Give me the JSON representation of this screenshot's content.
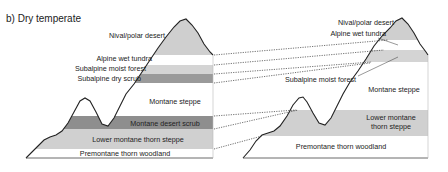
{
  "title": "b) Dry temperate",
  "left_mountain": {
    "zones": [
      {
        "label": "Nival/polar desert",
        "shade": "#cfcfcf"
      },
      {
        "label": "Alpine wet tundra",
        "shade": "#ffffff"
      },
      {
        "label": "Subalpine moist forest",
        "shade": "#d4d4d4"
      },
      {
        "label": "Subalpine dry scrub",
        "shade": "#9a9a9a"
      },
      {
        "label": "Montane steppe",
        "shade": "#ffffff"
      },
      {
        "label": "Montane desert scrub",
        "shade": "#8e8e8e"
      },
      {
        "label": "Lower montane thorn steppe",
        "shade": "#d0d0d0"
      },
      {
        "label": "Premontane thorn woodland",
        "shade": "#ffffff"
      }
    ]
  },
  "right_mountain": {
    "zones": [
      {
        "label": "Nival/polar desert",
        "shade": "#cfcfcf"
      },
      {
        "label": "Alpine wet tundra",
        "shade": "#ffffff"
      },
      {
        "label": "Subalpine moist forest",
        "shade": "#d4d4d4"
      },
      {
        "label": "Montane steppe",
        "shade": "#ffffff"
      },
      {
        "label": "Lower montane",
        "label2": "thorn steppe",
        "shade": "#d0d0d0"
      },
      {
        "label": "Premontane thorn woodland",
        "shade": "#ffffff"
      }
    ]
  }
}
